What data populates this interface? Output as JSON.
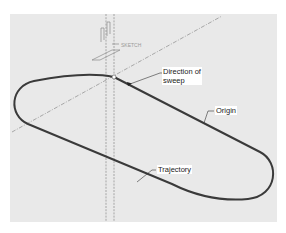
{
  "figure": {
    "title": "",
    "background_color": "#e9e9e9",
    "trajectory_color": "#3a3a3a",
    "datum_color": "#8a8a8a"
  },
  "datum": {
    "label": "SKETCH"
  },
  "callouts": {
    "direction": "Direction of sweep",
    "direction_line1": "Direction of",
    "direction_line2": "sweep",
    "origin": "Origin",
    "trajectory": "Trajectory"
  }
}
